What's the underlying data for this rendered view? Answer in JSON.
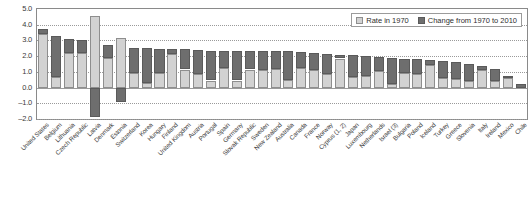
{
  "legend": {
    "items": [
      {
        "label": "Rate in 1970",
        "color": "#d2d2d2",
        "key": "rate_1970"
      },
      {
        "label": "Change from 1970 to 2010",
        "color": "#6e6e6e",
        "key": "change_1970_2010"
      }
    ]
  },
  "axis": {
    "y_ticks": [
      "5.0",
      "4.0",
      "3.0",
      "2.0",
      "1.0",
      "0.0",
      "-1.0",
      "-2.0"
    ],
    "y_min": -2.0,
    "y_max": 5.0,
    "y_step": 1.0
  },
  "chart_data": {
    "type": "bar",
    "stacked": true,
    "title": "",
    "xlabel": "",
    "ylabel": "",
    "ylim": [
      -2.0,
      5.0
    ],
    "ytick_values": [
      5.0,
      4.0,
      3.0,
      2.0,
      1.0,
      0.0,
      -1.0,
      -2.0
    ],
    "grid": true,
    "legend_position": "top-right",
    "categories": [
      "United States",
      "Belgium",
      "Lithuania",
      "Czech Republic",
      "Latvia",
      "Denmark",
      "Estonia",
      "Switzerland",
      "Korea",
      "Hungary",
      "Finland",
      "United Kingdom",
      "Austria",
      "Portugal",
      "Spain",
      "Germany",
      "Slovak Republic",
      "Sweden",
      "New Zealand",
      "Australia",
      "Canada",
      "France",
      "Norway",
      "Cyprus (1, 2)",
      "Japan",
      "Luxembourg",
      "Netherlands",
      "Israel (3)",
      "Bulgaria",
      "Poland",
      "Iceland",
      "Turkey",
      "Greece",
      "Slovenia",
      "Italy",
      "Ireland",
      "Mexico",
      "Chile"
    ],
    "series": [
      {
        "name": "Rate in 1970",
        "color": "#d2d2d2",
        "values": [
          3.4,
          0.65,
          2.2,
          2.2,
          4.55,
          1.9,
          3.15,
          0.95,
          0.3,
          0.9,
          2.15,
          1.15,
          0.85,
          0.45,
          1.25,
          0.45,
          1.15,
          1.1,
          1.2,
          0.5,
          1.25,
          1.15,
          0.85,
          1.85,
          0.65,
          0.75,
          1.05,
          0.2,
          0.95,
          0.85,
          1.45,
          0.6,
          0.55,
          0.45,
          1.1,
          0.4,
          0.6,
          0.0
        ]
      },
      {
        "name": "Change from 1970 to 2010",
        "color": "#6e6e6e",
        "values": [
          0.3,
          2.65,
          0.9,
          0.8,
          -1.9,
          0.8,
          -0.9,
          1.6,
          2.2,
          1.55,
          0.3,
          1.3,
          1.55,
          1.9,
          1.1,
          1.9,
          1.2,
          1.25,
          1.1,
          1.8,
          1.0,
          1.05,
          1.3,
          0.25,
          1.4,
          1.25,
          0.9,
          1.7,
          0.9,
          0.95,
          0.3,
          1.1,
          1.05,
          1.05,
          0.3,
          0.8,
          0.15,
          0.25
        ]
      }
    ]
  }
}
